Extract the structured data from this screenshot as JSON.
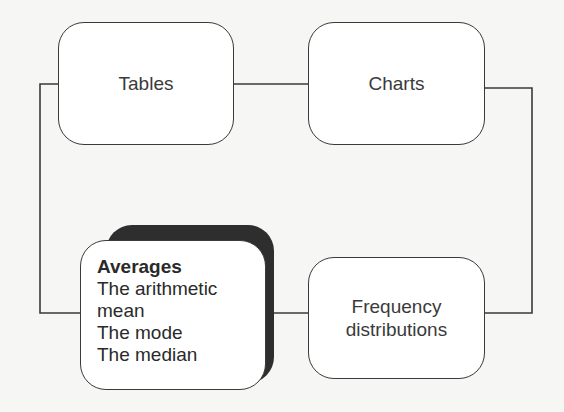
{
  "diagram": {
    "type": "flow-cycle",
    "nodes": [
      {
        "id": "tables",
        "label": "Tables"
      },
      {
        "id": "charts",
        "label": "Charts"
      },
      {
        "id": "frequency",
        "label_lines": [
          "Frequency",
          "distributions"
        ]
      },
      {
        "id": "averages",
        "title": "Averages",
        "items": [
          "The arithmetic",
          "mean",
          "The mode",
          "The median"
        ],
        "highlighted": true
      }
    ],
    "edges": [
      {
        "from": "tables",
        "to": "charts"
      },
      {
        "from": "charts",
        "to": "frequency"
      },
      {
        "from": "frequency",
        "to": "averages"
      },
      {
        "from": "averages",
        "to": "tables"
      }
    ],
    "colors": {
      "stroke": "#3a3a3a",
      "box_fill": "#ffffff",
      "shadow": "#2e2e2e",
      "background": "#f6f6f4"
    }
  }
}
